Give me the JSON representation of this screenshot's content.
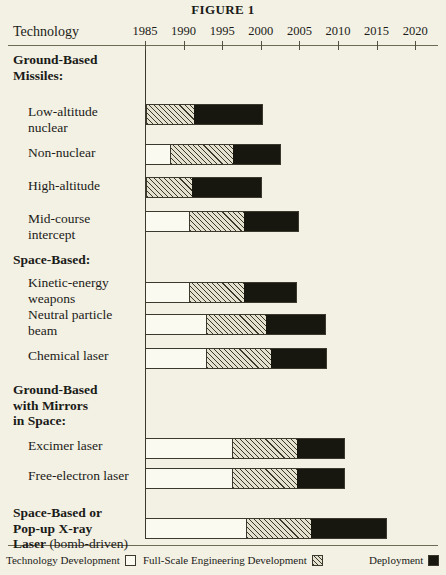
{
  "figure": {
    "title": "FIGURE 1",
    "row_header": "Technology"
  },
  "legend": {
    "items": [
      {
        "label": "Technology Development",
        "swatch": "white-box",
        "left": 6
      },
      {
        "label": "Full-Scale Engineering Development",
        "swatch": "hatched-box",
        "left": 143
      },
      {
        "label": "Deployment",
        "swatch": "black-box",
        "left": 369
      }
    ]
  },
  "colors": {
    "page_background": "#f3f1e4",
    "ink": "#1b1b18",
    "rule": "#6d6a55",
    "technology_development": "#fbfaf0",
    "full_scale_engineering_development": "#e4e1cf",
    "deployment": "#17160f"
  },
  "chart_data": {
    "type": "bar",
    "subtype": "gantt-timeline",
    "title": "FIGURE 1",
    "xlabel": "",
    "ylabel": "Technology",
    "xlim": [
      1985,
      2022
    ],
    "ticks": [
      1985,
      1990,
      1995,
      2000,
      2005,
      2010,
      2015,
      2020
    ],
    "tick_labels": [
      "1985",
      "1990",
      "1995",
      "2000",
      "2005",
      "2010",
      "2015",
      "2020"
    ],
    "grid": false,
    "legend_position": "bottom",
    "phases": [
      "Technology Development",
      "Full-Scale Engineering Development",
      "Deployment"
    ],
    "groups": [
      {
        "name": "Ground-Based Missiles:",
        "label_lines": "Ground-Based\nMissiles:",
        "rows": [
          {
            "label": "Low-altitude\nnuclear",
            "name": "Low-altitude nuclear",
            "technology_development": [
              1985.0,
              1985.0
            ],
            "full_scale_engineering_development": [
              1985.0,
              1991.3
            ],
            "deployment": [
              1991.3,
              2000.3
            ]
          },
          {
            "label": "Non-nuclear",
            "name": "Non-nuclear",
            "technology_development": [
              1985.0,
              1988.2
            ],
            "full_scale_engineering_development": [
              1988.2,
              1996.5
            ],
            "deployment": [
              1996.5,
              2002.6
            ]
          },
          {
            "label": "High-altitude",
            "name": "High-altitude",
            "technology_development": [
              1985.0,
              1985.0
            ],
            "full_scale_engineering_development": [
              1985.0,
              1991.1
            ],
            "deployment": [
              1991.1,
              2000.2
            ]
          },
          {
            "label": "Mid-course\nintercept",
            "name": "Mid-course intercept",
            "technology_development": [
              1985.0,
              1990.6
            ],
            "full_scale_engineering_development": [
              1990.6,
              1997.9
            ],
            "deployment": [
              1997.9,
              2004.9
            ]
          }
        ]
      },
      {
        "name": "Space-Based:",
        "label_lines": "Space-Based:",
        "rows": [
          {
            "label": "Kinetic-energy\nweapons",
            "name": "Kinetic-energy weapons",
            "technology_development": [
              1985.0,
              1990.7
            ],
            "full_scale_engineering_development": [
              1990.7,
              1997.9
            ],
            "deployment": [
              1997.9,
              2004.7
            ]
          },
          {
            "label": "Neutral particle\nbeam",
            "name": "Neutral particle beam",
            "technology_development": [
              1985.0,
              1992.9
            ],
            "full_scale_engineering_development": [
              1992.9,
              2000.7
            ],
            "deployment": [
              2000.7,
              2008.4
            ]
          },
          {
            "label": "Chemical laser",
            "name": "Chemical laser",
            "technology_development": [
              1985.0,
              1992.9
            ],
            "full_scale_engineering_development": [
              1992.9,
              2001.4
            ],
            "deployment": [
              2001.4,
              2008.6
            ]
          }
        ]
      },
      {
        "name": "Ground-Based with Mirrors in Space:",
        "label_lines": "Ground-Based\nwith Mirrors\nin Space:",
        "rows": [
          {
            "label": "Excimer laser",
            "name": "Excimer laser",
            "technology_development": [
              1985.0,
              1996.3
            ],
            "full_scale_engineering_development": [
              1996.3,
              2004.8
            ],
            "deployment": [
              2004.8,
              2010.9
            ]
          },
          {
            "label": "Free-electron laser",
            "name": "Free-electron laser",
            "technology_development": [
              1985.0,
              1996.3
            ],
            "full_scale_engineering_development": [
              1996.3,
              2004.7
            ],
            "deployment": [
              2004.7,
              2010.9
            ]
          }
        ]
      },
      {
        "name": "Space-Based or Pop-up X-ray Laser (bomb-driven)",
        "label_lines": "Space-Based or\nPop-up X-ray\nLaser (bomb-driven)",
        "label_bold_prefix": "Space-Based or\nPop-up X-ray\nLaser",
        "label_normal_suffix": " (bomb-driven)",
        "rows": [
          {
            "label": "",
            "name": "Space-Based or Pop-up X-ray Laser (bomb-driven)",
            "technology_development": [
              1985.0,
              1998.1
            ],
            "full_scale_engineering_development": [
              1998.1,
              2006.6
            ],
            "deployment": [
              2006.6,
              2016.3
            ]
          }
        ]
      }
    ]
  },
  "layout": {
    "axis_origin_x": 145,
    "px_per_year": 7.72,
    "rows_y": {
      "group_ground_missiles": 52,
      "low_altitude": 104,
      "non_nuclear": 145,
      "high_altitude": 178,
      "mid_course": 211,
      "group_space_based": 252,
      "kinetic_energy": 275,
      "neutral_particle": 307,
      "chemical_laser": 348,
      "group_ground_mirrors": 382,
      "excimer": 438,
      "free_electron": 468,
      "group_xray": 505,
      "xray_bar": 518
    }
  }
}
